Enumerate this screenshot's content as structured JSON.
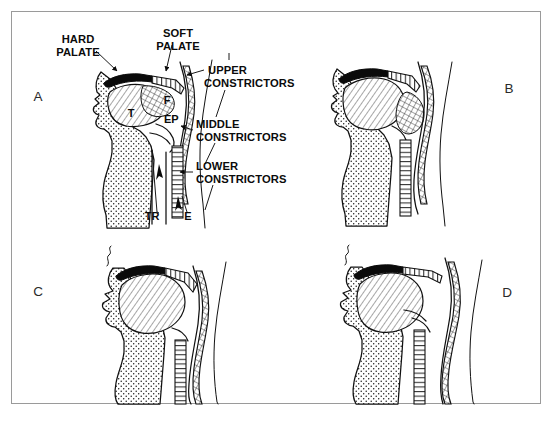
{
  "figure": {
    "border_color": "#9a9a9a",
    "ink_color": "#111111",
    "background": "#ffffff",
    "panel_count": 4
  },
  "panels": [
    {
      "id": "A",
      "letter": "A",
      "letter_x": 38,
      "letter_y": 101
    },
    {
      "id": "B",
      "letter": "B",
      "letter_x": 509,
      "letter_y": 93
    },
    {
      "id": "C",
      "letter": "C",
      "letter_x": 38,
      "letter_y": 296
    },
    {
      "id": "D",
      "letter": "D",
      "letter_x": 507,
      "letter_y": 297
    }
  ],
  "callout_labels": [
    {
      "key": "hard_palate",
      "lines": [
        "HARD",
        "PALATE"
      ],
      "text_x": 78,
      "text_y": 43,
      "anchor": "middle",
      "arrow": "hard-palate-arrow"
    },
    {
      "key": "soft_palate",
      "lines": [
        "SOFT",
        "PALATE"
      ],
      "text_x": 178,
      "text_y": 37,
      "anchor": "middle",
      "arrow": "soft-palate-arrow"
    },
    {
      "key": "upper_constrictors",
      "lines": [
        "UPPER",
        "CONSTRICTORS"
      ],
      "text_x": 208,
      "text_y": 74,
      "anchor": "start",
      "arrow": "upper-constrictors-arrow"
    },
    {
      "key": "middle_constrictors",
      "lines": [
        "MIDDLE",
        "CONSTRICTORS"
      ],
      "text_x": 196,
      "text_y": 128,
      "anchor": "start",
      "arrow": "middle-constrictors-arrow"
    },
    {
      "key": "lower_constrictors",
      "lines": [
        "LOWER",
        "CONSTRICTORS"
      ],
      "text_x": 196,
      "text_y": 170,
      "anchor": "start",
      "arrow": "lower-constrictors-arrow"
    }
  ],
  "inner_labels": [
    {
      "key": "tongue",
      "text": "T",
      "x": 131,
      "y": 117
    },
    {
      "key": "food_bolus",
      "text": "F",
      "x": 167,
      "y": 104
    },
    {
      "key": "epiglottis",
      "text": "EP",
      "x": 164,
      "y": 123
    },
    {
      "key": "trachea",
      "text": "TR",
      "x": 152,
      "y": 220
    },
    {
      "key": "esophagus",
      "text": "E",
      "x": 188,
      "y": 220
    }
  ],
  "legend_meaning": {
    "T": "tongue",
    "F": "food bolus",
    "EP": "epiglottis",
    "TR": "trachea",
    "E": "esophagus"
  },
  "textures": {
    "hard_palate": "solid-black",
    "soft_palate": "vertical-ladder-hatch",
    "tongue": "diagonal-hatch",
    "soft_tissue": "stipple-dots",
    "constrictor_muscle": "cross-hatch",
    "trachea_rings": "horizontal-ladder"
  }
}
